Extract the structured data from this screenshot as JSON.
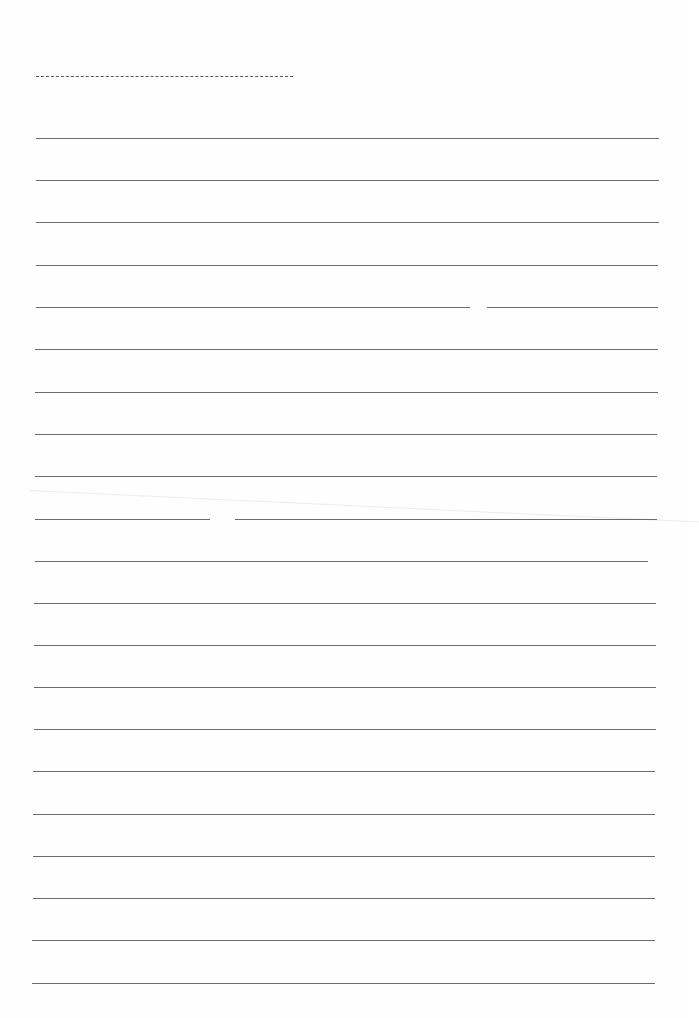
{
  "page": {
    "type": "lined-paper",
    "background": "#fefefe",
    "line_color": "#6a6a6a",
    "title_field": {
      "label": "",
      "value": ""
    },
    "line_count": 21,
    "lines": [
      {
        "y": 138,
        "x1": 36,
        "x2": 659,
        "text": ""
      },
      {
        "y": 180,
        "x1": 36,
        "x2": 659,
        "text": ""
      },
      {
        "y": 222,
        "x1": 36,
        "x2": 659,
        "text": ""
      },
      {
        "y": 265,
        "x1": 36,
        "x2": 658,
        "text": ""
      },
      {
        "y": 307,
        "x1": 36,
        "x2": 658,
        "text": "",
        "gap": [
          470,
          487
        ]
      },
      {
        "y": 349,
        "x1": 35,
        "x2": 658,
        "text": ""
      },
      {
        "y": 392,
        "x1": 35,
        "x2": 658,
        "text": ""
      },
      {
        "y": 434,
        "x1": 35,
        "x2": 657,
        "text": ""
      },
      {
        "y": 476,
        "x1": 35,
        "x2": 657,
        "text": ""
      },
      {
        "y": 519,
        "x1": 35,
        "x2": 657,
        "text": "",
        "gap": [
          210,
          235
        ]
      },
      {
        "y": 561,
        "x1": 35,
        "x2": 648,
        "text": ""
      },
      {
        "y": 603,
        "x1": 34,
        "x2": 656,
        "text": ""
      },
      {
        "y": 645,
        "x1": 34,
        "x2": 656,
        "text": ""
      },
      {
        "y": 687,
        "x1": 34,
        "x2": 656,
        "text": ""
      },
      {
        "y": 729,
        "x1": 34,
        "x2": 656,
        "text": ""
      },
      {
        "y": 771,
        "x1": 33,
        "x2": 655,
        "text": ""
      },
      {
        "y": 814,
        "x1": 33,
        "x2": 655,
        "text": ""
      },
      {
        "y": 856,
        "x1": 33,
        "x2": 655,
        "text": ""
      },
      {
        "y": 898,
        "x1": 33,
        "x2": 655,
        "text": ""
      },
      {
        "y": 940,
        "x1": 32,
        "x2": 655,
        "text": ""
      },
      {
        "y": 983,
        "x1": 32,
        "x2": 655,
        "text": ""
      }
    ]
  }
}
